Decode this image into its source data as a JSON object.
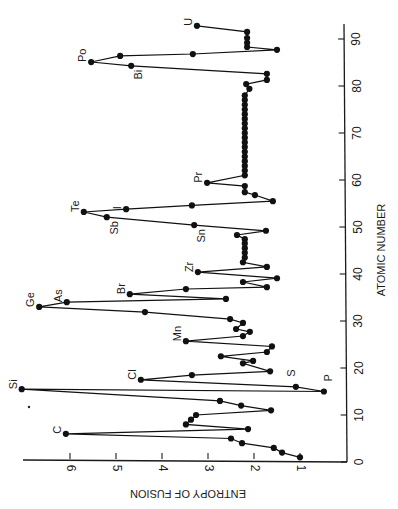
{
  "chart_data": {
    "type": "line",
    "orientation": "rotated-90-clockwise",
    "title": "",
    "xlabel": "ATOMIC NUMBER",
    "ylabel": "ENTROPY OF FUSION",
    "xlim": [
      0,
      92
    ],
    "ylim": [
      0,
      7
    ],
    "xticks": [
      0,
      10,
      20,
      30,
      40,
      50,
      60,
      70,
      80,
      90
    ],
    "yticks": [
      1,
      2,
      3,
      4,
      5,
      6
    ],
    "grid": false,
    "legend": null,
    "series": [
      {
        "name": "Entropy of fusion",
        "marker": "filled-circle",
        "points": [
          {
            "z": 1,
            "s": 1.0
          },
          {
            "z": 2,
            "s": 1.39
          },
          {
            "z": 3,
            "s": 1.57
          },
          {
            "z": 4,
            "s": 2.26
          },
          {
            "z": 5,
            "s": 2.5
          },
          {
            "z": 6,
            "s": 6.09,
            "label": "C"
          },
          {
            "z": 7,
            "s": 2.13
          },
          {
            "z": 8,
            "s": 3.48
          },
          {
            "z": 9,
            "s": 3.37
          },
          {
            "z": 10,
            "s": 3.26
          },
          {
            "z": 11,
            "s": 1.63
          },
          {
            "z": 12,
            "s": 2.28
          },
          {
            "z": 13,
            "s": 2.74
          },
          {
            "z": 15.5,
            "s": 7.05,
            "label": "Si"
          },
          {
            "z": 15,
            "s": 0.48,
            "label": "P"
          },
          {
            "z": 16,
            "s": 1.09,
            "label": "S"
          },
          {
            "z": 17.5,
            "s": 4.46,
            "label": "Cl"
          },
          {
            "z": 18.5,
            "s": 3.35
          },
          {
            "z": 19.3,
            "s": 1.65
          },
          {
            "z": 21,
            "s": 2.24
          },
          {
            "z": 21.5,
            "s": 2.02
          },
          {
            "z": 22.5,
            "s": 2.72
          },
          {
            "z": 23.4,
            "s": 1.72
          },
          {
            "z": 24.6,
            "s": 1.61
          },
          {
            "z": 25.7,
            "s": 3.48,
            "label": "Mn"
          },
          {
            "z": 26.8,
            "s": 2.24
          },
          {
            "z": 27.7,
            "s": 2.09
          },
          {
            "z": 28.3,
            "s": 2.39
          },
          {
            "z": 29.6,
            "s": 2.24
          },
          {
            "z": 30.4,
            "s": 2.52
          },
          {
            "z": 31.9,
            "s": 4.37
          },
          {
            "z": 33,
            "s": 6.67,
            "label": "Ge"
          },
          {
            "z": 34,
            "s": 6.07,
            "label": "As"
          },
          {
            "z": 34.7,
            "s": 2.61
          },
          {
            "z": 35.7,
            "s": 4.7,
            "label": "Br"
          },
          {
            "z": 36.8,
            "s": 3.48
          },
          {
            "z": 37.2,
            "s": 1.72
          },
          {
            "z": 38.3,
            "s": 2.24
          },
          {
            "z": 39.1,
            "s": 1.5
          },
          {
            "z": 40.4,
            "s": 3.22,
            "label": "Zr"
          },
          {
            "z": 41.5,
            "s": 1.72
          },
          {
            "z": 42.5,
            "s": 2.24
          },
          {
            "z": 43.5,
            "s": 2.2
          },
          {
            "z": 44.5,
            "s": 2.2
          },
          {
            "z": 45.5,
            "s": 2.2
          },
          {
            "z": 46.5,
            "s": 2.2
          },
          {
            "z": 47.4,
            "s": 2.2
          },
          {
            "z": 48.3,
            "s": 2.37
          },
          {
            "z": 49.2,
            "s": 1.74
          },
          {
            "z": 50.4,
            "s": 3.3,
            "label": "Sn"
          },
          {
            "z": 52.1,
            "s": 5.2,
            "label": "Sb"
          },
          {
            "z": 53.2,
            "s": 5.7,
            "label": "Te"
          },
          {
            "z": 53.8,
            "s": 4.78,
            "label": "I"
          },
          {
            "z": 54.6,
            "s": 3.35
          },
          {
            "z": 55.5,
            "s": 1.59
          },
          {
            "z": 56.8,
            "s": 1.98
          },
          {
            "z": 57.4,
            "s": 2.2
          },
          {
            "z": 58.7,
            "s": 2.2
          },
          {
            "z": 59.4,
            "s": 3.02,
            "label": "Pr"
          },
          {
            "z": 61,
            "s": 2.2
          },
          {
            "z": 62,
            "s": 2.2
          },
          {
            "z": 63,
            "s": 2.2
          },
          {
            "z": 64,
            "s": 2.2
          },
          {
            "z": 65,
            "s": 2.2
          },
          {
            "z": 66,
            "s": 2.2
          },
          {
            "z": 67,
            "s": 2.2
          },
          {
            "z": 68,
            "s": 2.2
          },
          {
            "z": 69,
            "s": 2.2
          },
          {
            "z": 70,
            "s": 2.2
          },
          {
            "z": 71,
            "s": 2.2
          },
          {
            "z": 72,
            "s": 2.2
          },
          {
            "z": 73,
            "s": 2.2
          },
          {
            "z": 74,
            "s": 2.2
          },
          {
            "z": 75,
            "s": 2.2
          },
          {
            "z": 76,
            "s": 2.2
          },
          {
            "z": 77,
            "s": 2.2
          },
          {
            "z": 78,
            "s": 2.2
          },
          {
            "z": 79.4,
            "s": 2.1
          },
          {
            "z": 80.4,
            "s": 2.17
          },
          {
            "z": 81.3,
            "s": 1.72
          },
          {
            "z": 82.6,
            "s": 1.72
          },
          {
            "z": 84.3,
            "s": 4.67,
            "label": "Bi"
          },
          {
            "z": 85.1,
            "s": 5.54,
            "label": "Po"
          },
          {
            "z": 86.4,
            "s": 4.91
          },
          {
            "z": 86.8,
            "s": 3.33
          },
          {
            "z": 87.7,
            "s": 1.5
          },
          {
            "z": 88.3,
            "s": 2.15
          },
          {
            "z": 89.2,
            "s": 2.15
          },
          {
            "z": 90.2,
            "s": 2.15
          },
          {
            "z": 91.5,
            "s": 2.15
          },
          {
            "z": 92.8,
            "s": 3.24,
            "label": "U"
          }
        ]
      }
    ],
    "annotations": [
      "C",
      "Si",
      "P",
      "S",
      "Cl",
      "Mn",
      "Ge",
      "As",
      "Br",
      "Zr",
      "Sn",
      "Sb",
      "Te",
      "I",
      "Pr",
      "Bi",
      "Po",
      "U"
    ]
  },
  "axes": {
    "atomic_number_label": "ATOMIC NUMBER",
    "entropy_label": "ENTROPY OF FUSION",
    "atomic_number_ticks": [
      "0",
      "10",
      "20",
      "30",
      "40",
      "50",
      "60",
      "70",
      "80",
      "90"
    ],
    "entropy_ticks": [
      "1",
      "2",
      "3",
      "4",
      "5",
      "6"
    ]
  },
  "colors": {
    "ink": "#111111",
    "background": "#ffffff"
  }
}
